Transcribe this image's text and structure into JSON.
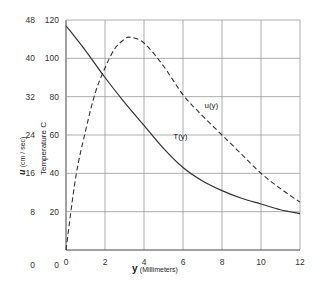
{
  "chart_data": {
    "type": "line",
    "title": "",
    "xlabel_prefix": "y",
    "xlabel": "(Millimeters)",
    "ylabel_left_outer_prefix": "u",
    "ylabel_left_outer": "(cm / sec)",
    "ylabel_left_inner": "Temperature  C",
    "xlim": [
      0,
      12
    ],
    "ylim": [
      0,
      120
    ],
    "ylim_u": [
      0,
      48
    ],
    "grid": true,
    "x_ticks": [
      "0",
      "2",
      "4",
      "6",
      "8",
      "10",
      "12"
    ],
    "y_ticks_temperature": [
      "0",
      "20",
      "40",
      "60",
      "80",
      "100",
      "120"
    ],
    "y_ticks_u": [
      "0",
      "8",
      "16",
      "24",
      "32",
      "40",
      "48"
    ],
    "series": [
      {
        "name": "T(y)",
        "style": "solid",
        "x": [
          0,
          1,
          2,
          3,
          4,
          5,
          6,
          7,
          8,
          9,
          10,
          11,
          12
        ],
        "values": [
          117,
          104,
          90,
          77,
          65,
          53,
          43,
          36,
          31,
          27,
          24,
          21,
          19
        ]
      },
      {
        "name": "u(y)",
        "style": "dashed",
        "x": [
          0,
          0.5,
          1,
          1.5,
          2,
          2.5,
          3,
          3.3,
          4,
          5,
          6,
          7,
          8,
          9,
          10,
          11,
          12
        ],
        "values": [
          0,
          38,
          62,
          82,
          95,
          105,
          110,
          111,
          108,
          96,
          81,
          70,
          60,
          50,
          40,
          32,
          25
        ],
        "values_u_scale": [
          0,
          15.2,
          24.8,
          32.8,
          38,
          42,
          44,
          44.4,
          43.2,
          38.4,
          32.4,
          28,
          24,
          20,
          16,
          12.8,
          10
        ]
      }
    ],
    "annotations": [
      {
        "text": "T(y)",
        "x": 5.5,
        "y": 58
      },
      {
        "text": "u(y)",
        "x": 7.1,
        "y": 74
      }
    ]
  }
}
